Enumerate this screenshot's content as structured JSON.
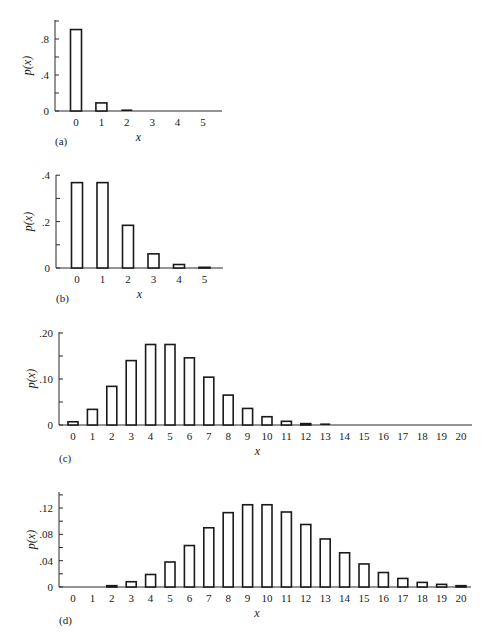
{
  "chart_data": [
    {
      "type": "bar",
      "panel_label": "(a)",
      "xlabel": "x",
      "ylabel": "p(x)",
      "categories": [
        "0",
        "1",
        "2",
        "3",
        "4",
        "5"
      ],
      "values": [
        0.905,
        0.09,
        0.005,
        0.0002,
        0.0,
        0.0
      ],
      "ylim": [
        0,
        1.0
      ],
      "yticks_major": [
        {
          "v": 0,
          "label": "0"
        },
        {
          "v": 0.4,
          "label": ".4"
        },
        {
          "v": 0.8,
          "label": ".8"
        }
      ],
      "yticks_minor": [
        0.2,
        0.6,
        1.0
      ],
      "geom": {
        "x0": 55,
        "x1": 222,
        "y0": 111,
        "ytop": 20,
        "first_center": 76,
        "spacing": 25.4,
        "bar_w": 11,
        "ypx_per_unit": 90
      }
    },
    {
      "type": "bar",
      "panel_label": "(b)",
      "xlabel": "x",
      "ylabel": "p(x)",
      "categories": [
        "0",
        "1",
        "2",
        "3",
        "4",
        "5"
      ],
      "values": [
        0.368,
        0.368,
        0.184,
        0.061,
        0.015,
        0.003
      ],
      "ylim": [
        0,
        0.4
      ],
      "yticks_major": [
        {
          "v": 0,
          "label": "0"
        },
        {
          "v": 0.2,
          "label": ".2"
        },
        {
          "v": 0.4,
          "label": ".4"
        }
      ],
      "yticks_minor": [
        0.1,
        0.3
      ],
      "geom": {
        "x0": 56,
        "x1": 223,
        "y0": 268,
        "ytop": 175,
        "first_center": 77,
        "spacing": 25.5,
        "bar_w": 11,
        "ypx_per_unit": 232
      }
    },
    {
      "type": "bar",
      "panel_label": "(c)",
      "xlabel": "x",
      "ylabel": "p(x)",
      "categories": [
        "0",
        "1",
        "2",
        "3",
        "4",
        "5",
        "6",
        "7",
        "8",
        "9",
        "10",
        "11",
        "12",
        "13",
        "14",
        "15",
        "16",
        "17",
        "18",
        "19",
        "20"
      ],
      "values": [
        0.007,
        0.034,
        0.084,
        0.14,
        0.175,
        0.175,
        0.146,
        0.104,
        0.065,
        0.036,
        0.018,
        0.008,
        0.003,
        0.001,
        0.0005,
        0.0002,
        0.0,
        0.0,
        0.0,
        0.0,
        0.0
      ],
      "ylim": [
        0,
        0.2
      ],
      "yticks_major": [
        {
          "v": 0,
          "label": "0"
        },
        {
          "v": 0.1,
          "label": ".10"
        },
        {
          "v": 0.2,
          "label": ".20"
        }
      ],
      "yticks_minor": [
        0.05,
        0.15
      ],
      "geom": {
        "x0": 59,
        "x1": 472,
        "y0": 425,
        "ytop": 332,
        "first_center": 73,
        "spacing": 19.4,
        "bar_w": 10,
        "ypx_per_unit": 460
      }
    },
    {
      "type": "bar",
      "panel_label": "(d)",
      "xlabel": "x",
      "ylabel": "p(x)",
      "categories": [
        "0",
        "1",
        "2",
        "3",
        "4",
        "5",
        "6",
        "7",
        "8",
        "9",
        "10",
        "11",
        "12",
        "13",
        "14",
        "15",
        "16",
        "17",
        "18",
        "19",
        "20"
      ],
      "values": [
        5e-05,
        0.0005,
        0.002,
        0.008,
        0.019,
        0.038,
        0.063,
        0.09,
        0.113,
        0.125,
        0.125,
        0.114,
        0.095,
        0.073,
        0.052,
        0.035,
        0.022,
        0.013,
        0.007,
        0.004,
        0.002
      ],
      "ylim": [
        0,
        0.14
      ],
      "yticks_major": [
        {
          "v": 0,
          "label": "0"
        },
        {
          "v": 0.04,
          "label": ".04"
        },
        {
          "v": 0.08,
          "label": ".08"
        },
        {
          "v": 0.12,
          "label": ".12"
        }
      ],
      "yticks_minor": [
        0.02,
        0.06,
        0.1,
        0.14
      ],
      "geom": {
        "x0": 59,
        "x1": 471,
        "y0": 587,
        "ytop": 492,
        "first_center": 73,
        "spacing": 19.4,
        "bar_w": 10,
        "ypx_per_unit": 658
      }
    }
  ]
}
